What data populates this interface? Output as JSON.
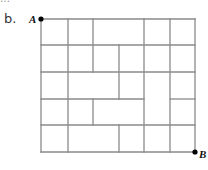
{
  "header": {
    "cutoff_text": "..."
  },
  "item_label": "b.",
  "diagram": {
    "type": "street-grid-path",
    "stroke_color": "#8a8a8a",
    "dot_color": "#000000",
    "grid": {
      "x": [
        41,
        68,
        93,
        119,
        144,
        170,
        195
      ],
      "y": [
        19,
        45,
        72,
        99,
        125,
        152
      ]
    },
    "points": [
      {
        "label": "A",
        "x": 41,
        "y": 19,
        "label_x": 29,
        "label_y": 23
      },
      {
        "label": "B",
        "x": 195,
        "y": 152,
        "label_x": 199,
        "label_y": 158
      }
    ],
    "segments": [
      {
        "x1": 41,
        "y1": 19,
        "x2": 195,
        "y2": 19
      },
      {
        "x1": 41,
        "y1": 45,
        "x2": 195,
        "y2": 45
      },
      {
        "x1": 41,
        "y1": 72,
        "x2": 195,
        "y2": 72
      },
      {
        "x1": 41,
        "y1": 99,
        "x2": 144,
        "y2": 99
      },
      {
        "x1": 170,
        "y1": 99,
        "x2": 195,
        "y2": 99
      },
      {
        "x1": 41,
        "y1": 125,
        "x2": 195,
        "y2": 125
      },
      {
        "x1": 41,
        "y1": 152,
        "x2": 195,
        "y2": 152
      },
      {
        "x1": 41,
        "y1": 19,
        "x2": 41,
        "y2": 152
      },
      {
        "x1": 68,
        "y1": 19,
        "x2": 68,
        "y2": 152
      },
      {
        "x1": 93,
        "y1": 19,
        "x2": 93,
        "y2": 72
      },
      {
        "x1": 93,
        "y1": 99,
        "x2": 93,
        "y2": 125
      },
      {
        "x1": 119,
        "y1": 45,
        "x2": 119,
        "y2": 99
      },
      {
        "x1": 119,
        "y1": 125,
        "x2": 119,
        "y2": 152
      },
      {
        "x1": 144,
        "y1": 19,
        "x2": 144,
        "y2": 152
      },
      {
        "x1": 170,
        "y1": 19,
        "x2": 170,
        "y2": 152
      },
      {
        "x1": 195,
        "y1": 19,
        "x2": 195,
        "y2": 152
      }
    ]
  }
}
